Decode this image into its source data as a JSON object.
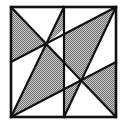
{
  "diagram": {
    "type": "geometric-dissection",
    "colors": {
      "background": "#ffffff",
      "stroke": "#111111",
      "shade": "#a8a8a8"
    },
    "square": {
      "x1": 11,
      "y1": 7,
      "x2": 116,
      "y2": 117
    },
    "vertical_line": {
      "x": 64
    },
    "points": {
      "TL": [
        11,
        7
      ],
      "TR": [
        116,
        7
      ],
      "BL": [
        11,
        117
      ],
      "BR": [
        116,
        117
      ],
      "top_mid": [
        64,
        7
      ],
      "bottom_mid": [
        64,
        117
      ],
      "left_mid": [
        11,
        62
      ],
      "right_mid": [
        116,
        62
      ],
      "P1": [
        46,
        44
      ],
      "P2": [
        81,
        79
      ]
    },
    "shaded_regions": 6
  }
}
